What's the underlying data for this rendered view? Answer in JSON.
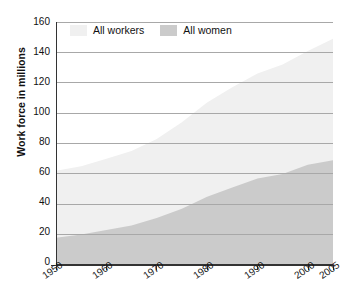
{
  "chart_data": {
    "type": "area",
    "title": "",
    "xlabel": "",
    "ylabel": "Work force in millions",
    "xlim": [
      1950,
      2005
    ],
    "ylim": [
      0,
      160
    ],
    "grid": true,
    "legend_position": "top-left",
    "x_ticks": [
      "1950",
      "1960",
      "1970",
      "1980",
      "1990",
      "2000",
      "2005"
    ],
    "y_ticks": [
      "0",
      "20",
      "40",
      "60",
      "80",
      "100",
      "120",
      "140",
      "160"
    ],
    "x": [
      1950,
      1955,
      1960,
      1965,
      1970,
      1975,
      1980,
      1985,
      1990,
      1995,
      2000,
      2005
    ],
    "series": [
      {
        "name": "All workers",
        "color": "#f0f0f0",
        "values": [
          62,
          65,
          70,
          75,
          83,
          94,
          107,
          117,
          126,
          132,
          141,
          149
        ]
      },
      {
        "name": "All women",
        "color": "#cbcbcb",
        "values": [
          18,
          20,
          23,
          26,
          31,
          37,
          45,
          51,
          57,
          60,
          66,
          69
        ]
      }
    ]
  },
  "legend": {
    "items": [
      {
        "label": "All workers",
        "color": "#f0f0f0"
      },
      {
        "label": "All women",
        "color": "#cbcbcb"
      }
    ]
  },
  "colors": {
    "all_workers": "#f0f0f0",
    "all_women": "#cbcbcb",
    "gridline": "#a8a8a8",
    "axis": "#333333",
    "text": "#111111",
    "background": "#ffffff"
  }
}
